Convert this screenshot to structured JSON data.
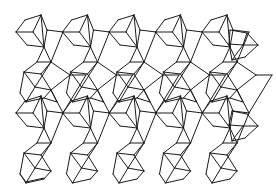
{
  "figure": {
    "kind": "isometric-cube-tessellation",
    "width": 276,
    "height": 194,
    "background": "#ffffff",
    "stroke": "#1a1a1a",
    "stroke_width": 1
  },
  "lattice": {
    "dx": 46.5,
    "dy": 81,
    "rows": [
      {
        "y_offset": 0,
        "count": 5,
        "x_start": 0
      },
      {
        "y_offset": 81,
        "count": 5,
        "x_start": 0
      }
    ]
  },
  "motif": {
    "cube_a": [
      [
        16,
        32,
        25,
        20
      ],
      [
        25,
        20,
        41,
        15
      ],
      [
        41,
        15,
        44,
        47
      ],
      [
        16,
        32,
        33,
        32
      ],
      [
        33,
        32,
        41,
        15
      ],
      [
        33,
        32,
        44,
        47
      ],
      [
        16,
        32,
        27,
        45
      ],
      [
        27,
        45,
        44,
        47
      ]
    ],
    "link_upper": [
      [
        41,
        15,
        47,
        30
      ],
      [
        47,
        30,
        63,
        32
      ],
      [
        44,
        47,
        47,
        30
      ],
      [
        44,
        47,
        51,
        62
      ],
      [
        51,
        62,
        63,
        32
      ],
      [
        44,
        47,
        37,
        62
      ],
      [
        37,
        62,
        51,
        62
      ]
    ],
    "cube_b": [
      [
        24,
        72,
        41,
        74
      ],
      [
        41,
        74,
        51,
        62
      ],
      [
        24,
        72,
        35,
        87
      ],
      [
        35,
        87,
        51,
        62
      ],
      [
        35,
        87,
        51,
        90
      ],
      [
        51,
        90,
        41,
        74
      ],
      [
        24,
        72,
        20,
        93
      ],
      [
        20,
        93,
        26,
        102
      ],
      [
        26,
        102,
        35,
        87
      ],
      [
        26,
        102,
        44,
        98
      ],
      [
        44,
        98,
        51,
        90
      ],
      [
        37,
        62,
        24,
        72
      ]
    ],
    "link_lower": [
      [
        51,
        90,
        63,
        113
      ],
      [
        51,
        62,
        70,
        75
      ],
      [
        70,
        75,
        51,
        90
      ],
      [
        70,
        75,
        86,
        75
      ],
      [
        86,
        75,
        63,
        113
      ],
      [
        51,
        90,
        57,
        102
      ],
      [
        44,
        98,
        57,
        102
      ]
    ]
  },
  "extras": {
    "right_cube_top": [
      [
        230,
        30,
        247,
        33
      ],
      [
        247,
        33,
        258,
        45
      ],
      [
        258,
        45,
        245,
        57
      ],
      [
        245,
        57,
        232,
        60
      ],
      [
        232,
        60,
        229,
        44
      ],
      [
        229,
        44,
        230,
        30
      ],
      [
        229,
        44,
        243,
        45
      ],
      [
        243,
        45,
        258,
        45
      ],
      [
        243,
        45,
        232,
        60
      ],
      [
        243,
        45,
        247,
        33
      ]
    ],
    "right_cube_mid": [
      [
        232,
        111,
        247,
        114
      ],
      [
        247,
        114,
        258,
        126
      ],
      [
        258,
        126,
        245,
        138
      ],
      [
        245,
        138,
        232,
        141
      ],
      [
        232,
        141,
        229,
        125
      ],
      [
        229,
        125,
        232,
        111
      ],
      [
        229,
        125,
        243,
        126
      ],
      [
        243,
        126,
        258,
        126
      ],
      [
        243,
        126,
        232,
        141
      ]
    ],
    "bottom_row_edges": [
      [
        20,
        174,
        26,
        182
      ],
      [
        26,
        182,
        44,
        178
      ]
    ]
  }
}
